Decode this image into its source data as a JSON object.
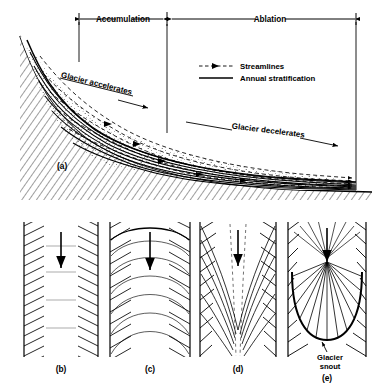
{
  "figure": {
    "title_zones": {
      "accumulation": "Accumulation",
      "ablation": "Ablation"
    },
    "legend": {
      "streamlines": "Streamlines",
      "annual_stratification": "Annual stratification"
    },
    "annotations": {
      "glacier_accelerates": "Glacier accelerates",
      "glacier_decelerates": "Glacier decelerates",
      "glacier_snout_line1": "Glacier",
      "glacier_snout_line2": "snout"
    },
    "panel_labels": {
      "a": "(a)",
      "b": "(b)",
      "c": "(c)",
      "d": "(d)",
      "e": "(e)"
    },
    "colors": {
      "ink": "#000000",
      "ice_stipple": "#333333",
      "bedrock_hatch": "#000000",
      "background": "#ffffff"
    }
  }
}
